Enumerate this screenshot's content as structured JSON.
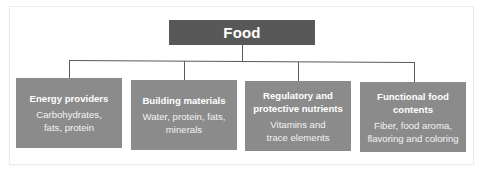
{
  "diagram": {
    "type": "hierarchy",
    "root": {
      "label": "Food"
    },
    "children": [
      {
        "title": "Energy providers",
        "desc_line1": "Carbohydrates,",
        "desc_line2": "fats, protein"
      },
      {
        "title": "Building materials",
        "desc_line1": "Water, protein, fats,",
        "desc_line2": "minerals"
      },
      {
        "title_line1": "Regulatory and",
        "title_line2": "protective nutrients",
        "desc_line1": "Vitamins and",
        "desc_line2": "trace elements"
      },
      {
        "title_line1": "Functional food",
        "title_line2": "contents",
        "desc_line1": "Fiber, food aroma,",
        "desc_line2": "flavoring and coloring"
      }
    ],
    "colors": {
      "root_fill": "#585858",
      "child_fill": "#8b8b8b",
      "connector": "#5a5a5a",
      "text": "#ffffff"
    }
  }
}
